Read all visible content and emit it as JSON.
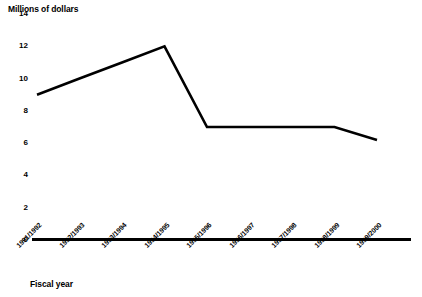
{
  "chart_data": {
    "type": "line",
    "title": "",
    "ylabel": "Millions of dollars",
    "xlabel": "Fiscal year",
    "categories": [
      "1991/1992",
      "1992/1993",
      "1993/1994",
      "1994/1995",
      "1995/1996",
      "1996/1997",
      "1997/1998",
      "1998/1999",
      "1999/2000"
    ],
    "values": [
      9,
      10,
      11,
      12,
      7,
      7,
      7,
      7,
      6.2
    ],
    "series": [
      {
        "name": "Funding",
        "values": [
          9,
          10,
          11,
          12,
          7,
          7,
          7,
          7,
          6.2
        ]
      }
    ],
    "ylim": [
      0,
      14
    ],
    "yticks": [
      0,
      2,
      4,
      6,
      8,
      10,
      12,
      14
    ],
    "ytick_labels": [
      "0",
      "2",
      "4",
      "6",
      "8",
      "10",
      "12",
      "14"
    ],
    "grid": false,
    "legend": "none",
    "line_color": "#000000",
    "background_color": "#ffffff",
    "axis_color": "#000000"
  }
}
